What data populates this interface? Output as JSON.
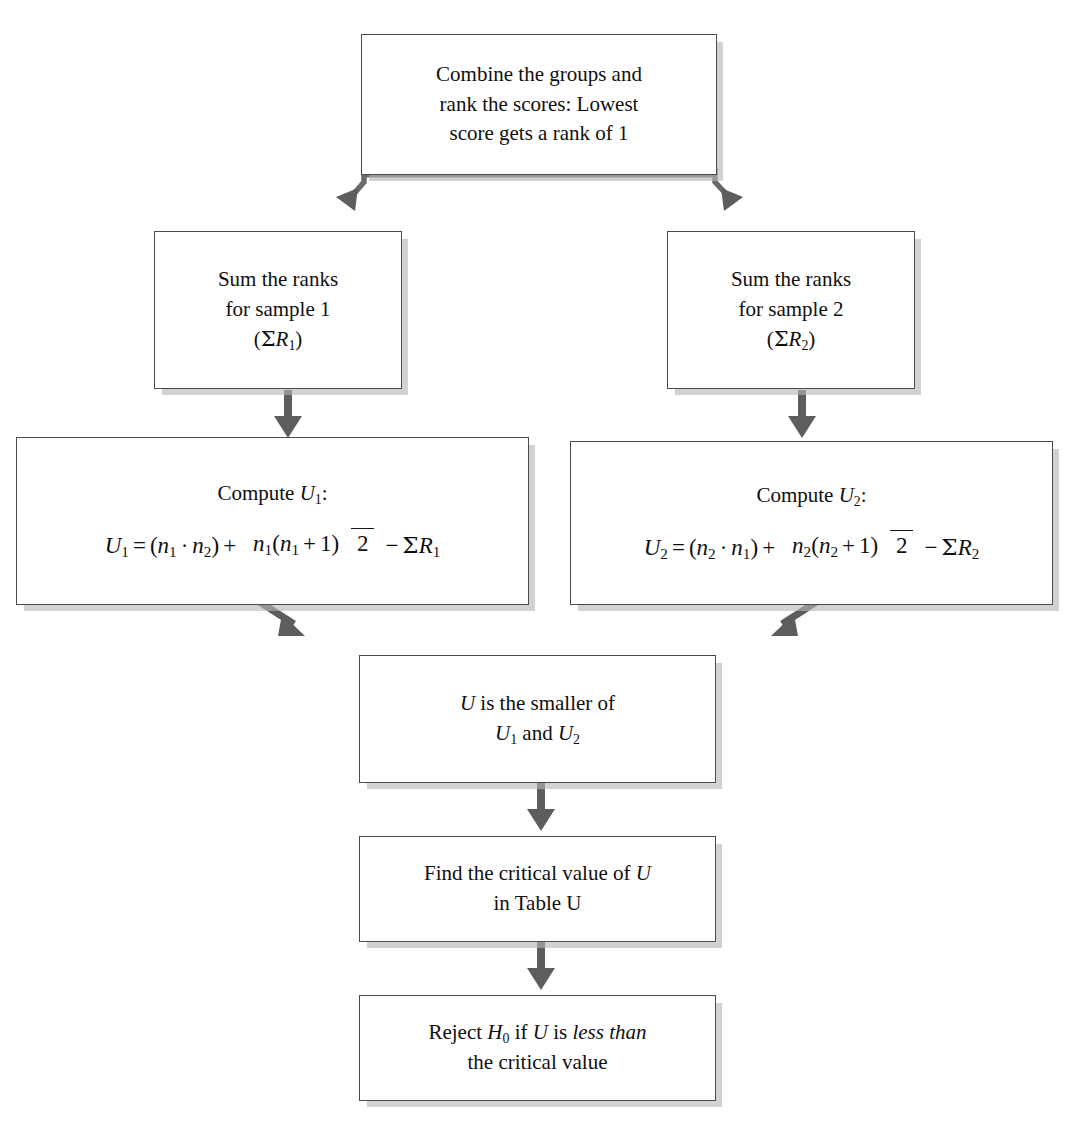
{
  "diagram": {
    "line_color": "#4b4b4b",
    "arrow_color": "#5a5a5a",
    "shadow_color": "#b7b7b7",
    "background": "#ffffff"
  },
  "nodes": {
    "combine": {
      "id": "combine-and-rank",
      "lines": [
        "Combine the groups and",
        "rank the scores:  Lowest",
        "score gets a rank of 1"
      ]
    },
    "sum1": {
      "id": "sum-ranks-sample-1",
      "lines": [
        "Sum the ranks",
        "for sample 1"
      ],
      "symbol_open": "(",
      "symbol_sigma": "Σ",
      "symbol_var": "R",
      "symbol_sub": "1",
      "symbol_close": ")"
    },
    "sum2": {
      "id": "sum-ranks-sample-2",
      "lines": [
        "Sum the ranks",
        "for sample 2"
      ],
      "symbol_open": "(",
      "symbol_sigma": "Σ",
      "symbol_var": "R",
      "symbol_sub": "2",
      "symbol_close": ")"
    },
    "computeU1": {
      "id": "compute-u1",
      "heading_prefix": "Compute ",
      "heading_var": "U",
      "heading_sub": "1",
      "heading_suffix": ":",
      "formula_text": "U1 = (n1 · n2) + n1(n1 + 1)/2 − ΣR1",
      "lhs_var": "U",
      "lhs_sub": "1",
      "equals": "=",
      "paren_open": "(",
      "p_var1": "n",
      "p_sub1": "1",
      "dot": "·",
      "p_var2": "n",
      "p_sub2": "2",
      "paren_close": ")",
      "plus": "+",
      "num_var_a": "n",
      "num_sub_a": "1",
      "num_paren_open": "(",
      "num_var_b": "n",
      "num_sub_b": "1",
      "num_plus": "+",
      "num_one": "1",
      "num_paren_close": ")",
      "denominator": "2",
      "minus": "−",
      "sigma": "Σ",
      "sum_var": "R",
      "sum_sub": "1"
    },
    "computeU2": {
      "id": "compute-u2",
      "heading_prefix": "Compute ",
      "heading_var": "U",
      "heading_sub": "2",
      "heading_suffix": ":",
      "formula_text": "U2 = (n2 · n1) + n2(n2 + 1)/2 − ΣR2",
      "lhs_var": "U",
      "lhs_sub": "2",
      "equals": "=",
      "paren_open": "(",
      "p_var1": "n",
      "p_sub1": "2",
      "dot": "·",
      "p_var2": "n",
      "p_sub2": "1",
      "paren_close": ")",
      "plus": "+",
      "num_var_a": "n",
      "num_sub_a": "2",
      "num_paren_open": "(",
      "num_var_b": "n",
      "num_sub_b": "2",
      "num_plus": "+",
      "num_one": "1",
      "num_paren_close": ")",
      "denominator": "2",
      "minus": "−",
      "sigma": "Σ",
      "sum_var": "R",
      "sum_sub": "2"
    },
    "smaller": {
      "id": "u-is-smaller",
      "var_u": "U",
      "text_1": " is the smaller of",
      "var_u1": "U",
      "sub_u1": "1",
      "conjunction": " and ",
      "var_u2": "U",
      "sub_u2": "2"
    },
    "critical": {
      "id": "find-critical-value",
      "text_1": "Find the critical value of ",
      "var_u": "U",
      "line_2": "in Table U"
    },
    "reject": {
      "id": "reject-h0",
      "text_1": "Reject ",
      "var_h": "H",
      "sub_h": "0",
      "text_2": " if ",
      "var_u": "U",
      "text_3": "  is ",
      "emphasis": "less than",
      "line_2": "the critical value"
    }
  },
  "connectors": [
    {
      "id": "combine-to-sum1",
      "kind": "diagonal-down-left"
    },
    {
      "id": "combine-to-sum2",
      "kind": "diagonal-down-right"
    },
    {
      "id": "sum1-to-u1",
      "kind": "vertical-down"
    },
    {
      "id": "sum2-to-u2",
      "kind": "vertical-down"
    },
    {
      "id": "u1-to-smaller",
      "kind": "diagonal-down-right"
    },
    {
      "id": "u2-to-smaller",
      "kind": "diagonal-down-left"
    },
    {
      "id": "smaller-to-critical",
      "kind": "vertical-down"
    },
    {
      "id": "critical-to-reject",
      "kind": "vertical-down"
    }
  ]
}
